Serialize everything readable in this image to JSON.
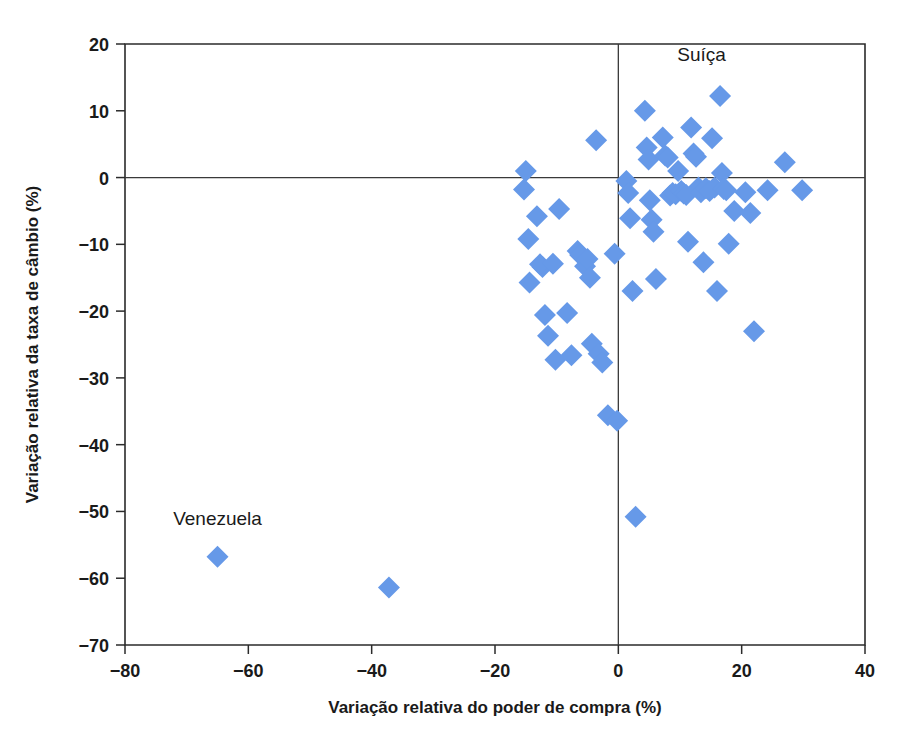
{
  "chart_data": {
    "type": "scatter",
    "title": "",
    "xlabel": "Variação relativa do poder de compra (%)",
    "ylabel": "Variação relativa da taxa de câmbio (%)",
    "xlim": [
      -80,
      40
    ],
    "ylim": [
      -70,
      20
    ],
    "xticks": [
      -80,
      -60,
      -40,
      -20,
      0,
      20,
      40
    ],
    "yticks": [
      20,
      10,
      0,
      -10,
      -20,
      -30,
      -40,
      -50,
      -60,
      -70
    ],
    "xticklabels": [
      "−80",
      "−60",
      "−40",
      "−20",
      "0",
      "20",
      "40"
    ],
    "yticklabels": [
      "20",
      "10",
      "0",
      "−10",
      "−20",
      "−30",
      "−40",
      "−50",
      "−60",
      "−70"
    ],
    "grid": false,
    "legend": null,
    "marker": "diamond",
    "marker_color": "#6699e8",
    "marker_size": 11,
    "zero_lines": {
      "x": 0,
      "y": 0,
      "color": "#3a3a3a"
    },
    "annotations": [
      {
        "text": "Suíça",
        "x": 13.5,
        "y": 17.5
      },
      {
        "text": "Venezuela",
        "x": -65.0,
        "y": -52.0
      }
    ],
    "points": [
      {
        "x": -65.0,
        "y": -56.8
      },
      {
        "x": -37.2,
        "y": -61.4
      },
      {
        "x": -15.0,
        "y": 1.0
      },
      {
        "x": -15.3,
        "y": -1.8
      },
      {
        "x": -14.6,
        "y": -9.2
      },
      {
        "x": -14.4,
        "y": -15.7
      },
      {
        "x": -13.2,
        "y": -5.8
      },
      {
        "x": -12.3,
        "y": -13.4
      },
      {
        "x": -12.7,
        "y": -13.0
      },
      {
        "x": -11.9,
        "y": -20.6
      },
      {
        "x": -11.4,
        "y": -23.7
      },
      {
        "x": -10.6,
        "y": -12.9
      },
      {
        "x": -10.2,
        "y": -27.3
      },
      {
        "x": -9.6,
        "y": -4.7
      },
      {
        "x": -8.3,
        "y": -20.3
      },
      {
        "x": -7.6,
        "y": -26.6
      },
      {
        "x": -6.6,
        "y": -11.0
      },
      {
        "x": -6.2,
        "y": -11.6
      },
      {
        "x": -5.4,
        "y": -13.3
      },
      {
        "x": -5.0,
        "y": -12.2
      },
      {
        "x": -4.6,
        "y": -15.0
      },
      {
        "x": -4.3,
        "y": -24.9
      },
      {
        "x": -3.6,
        "y": 5.6
      },
      {
        "x": -3.2,
        "y": -26.4
      },
      {
        "x": -2.6,
        "y": -27.7
      },
      {
        "x": -1.7,
        "y": -35.6
      },
      {
        "x": -0.6,
        "y": -11.4
      },
      {
        "x": -0.2,
        "y": -36.4
      },
      {
        "x": 1.3,
        "y": -0.5
      },
      {
        "x": 1.6,
        "y": -2.3
      },
      {
        "x": 1.9,
        "y": -6.1
      },
      {
        "x": 2.3,
        "y": -17.0
      },
      {
        "x": 2.8,
        "y": -50.8
      },
      {
        "x": 4.3,
        "y": 10.0
      },
      {
        "x": 4.6,
        "y": 4.5
      },
      {
        "x": 4.9,
        "y": 2.7
      },
      {
        "x": 5.1,
        "y": -3.4
      },
      {
        "x": 5.4,
        "y": -6.3
      },
      {
        "x": 5.7,
        "y": -8.1
      },
      {
        "x": 6.1,
        "y": -15.2
      },
      {
        "x": 7.2,
        "y": 6.0
      },
      {
        "x": 7.6,
        "y": 3.3
      },
      {
        "x": 8.0,
        "y": 3.0
      },
      {
        "x": 8.4,
        "y": -2.7
      },
      {
        "x": 8.8,
        "y": -2.3
      },
      {
        "x": 9.3,
        "y": -2.5
      },
      {
        "x": 9.7,
        "y": 1.0
      },
      {
        "x": 10.2,
        "y": -2.0
      },
      {
        "x": 10.6,
        "y": -2.4
      },
      {
        "x": 11.0,
        "y": -2.6
      },
      {
        "x": 11.3,
        "y": -9.6
      },
      {
        "x": 11.8,
        "y": 7.5
      },
      {
        "x": 12.2,
        "y": 3.6
      },
      {
        "x": 12.6,
        "y": 3.1
      },
      {
        "x": 13.0,
        "y": -1.5
      },
      {
        "x": 13.4,
        "y": -2.2
      },
      {
        "x": 13.8,
        "y": -12.7
      },
      {
        "x": 14.2,
        "y": -1.6
      },
      {
        "x": 14.8,
        "y": -2.0
      },
      {
        "x": 15.2,
        "y": 5.9
      },
      {
        "x": 15.6,
        "y": -1.5
      },
      {
        "x": 16.0,
        "y": -17.0
      },
      {
        "x": 16.5,
        "y": 12.2
      },
      {
        "x": 16.8,
        "y": 0.7
      },
      {
        "x": 17.1,
        "y": -1.7
      },
      {
        "x": 17.5,
        "y": -1.9
      },
      {
        "x": 17.9,
        "y": -9.9
      },
      {
        "x": 18.8,
        "y": -5.0
      },
      {
        "x": 20.6,
        "y": -2.2
      },
      {
        "x": 21.4,
        "y": -5.3
      },
      {
        "x": 22.0,
        "y": -23.0
      },
      {
        "x": 24.2,
        "y": -1.9
      },
      {
        "x": 27.0,
        "y": 2.3
      },
      {
        "x": 29.8,
        "y": -1.9
      }
    ]
  },
  "axes": {
    "x_title": "Variação relativa do poder de compra (%)",
    "y_title": "Variação relativa da taxa de câmbio (%)"
  }
}
